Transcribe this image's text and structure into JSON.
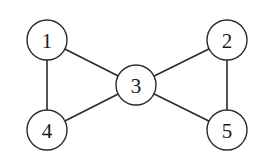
{
  "graph": {
    "nodes": [
      {
        "id": "1",
        "label": "1",
        "x": 47,
        "y": 40
      },
      {
        "id": "2",
        "label": "2",
        "x": 227,
        "y": 40
      },
      {
        "id": "3",
        "label": "3",
        "x": 136,
        "y": 85
      },
      {
        "id": "4",
        "label": "4",
        "x": 47,
        "y": 130
      },
      {
        "id": "5",
        "label": "5",
        "x": 227,
        "y": 130
      }
    ],
    "edges": [
      {
        "from": "1",
        "to": "3"
      },
      {
        "from": "1",
        "to": "4"
      },
      {
        "from": "4",
        "to": "3"
      },
      {
        "from": "3",
        "to": "2"
      },
      {
        "from": "3",
        "to": "5"
      },
      {
        "from": "2",
        "to": "5"
      }
    ],
    "node_radius": 20,
    "colors": {
      "stroke": "#2a2a2a",
      "fill": "#ffffff",
      "text": "#1a1a1a"
    }
  }
}
